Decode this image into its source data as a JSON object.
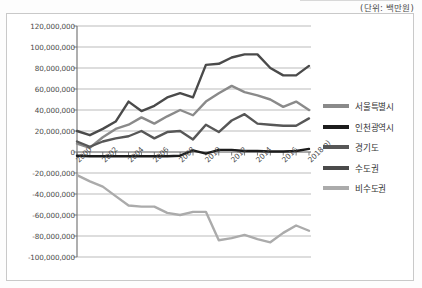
{
  "caption": {
    "unit_note": "(단위: 백만원)"
  },
  "legend": {
    "position": "right",
    "items": [
      {
        "label": "서울특별시",
        "color": "#8a8a8a"
      },
      {
        "label": "인천광역시",
        "color": "#1c1c1c"
      },
      {
        "label": "경기도",
        "color": "#575757"
      },
      {
        "label": "수도권",
        "color": "#4a4a4a"
      },
      {
        "label": "비수도권",
        "color": "#ababab"
      }
    ]
  },
  "chart_data": {
    "type": "line",
    "title": "",
    "subtitle": "",
    "xlabel": "",
    "ylabel": "",
    "unit": "백만원",
    "grid": true,
    "legend_position": "right",
    "ylim": [
      -100000000,
      120000000
    ],
    "ytick_step": 20000000,
    "ytick_labels": [
      "120,000,000",
      "100,000,000",
      "80,000,000",
      "60,000,000",
      "40,000,000",
      "20,000,000",
      "0",
      "-20,000,000",
      "-40,000,000",
      "-60,000,000",
      "-80,000,000",
      "-100,000,000"
    ],
    "ytick_values": [
      120000000,
      100000000,
      80000000,
      60000000,
      40000000,
      20000000,
      0,
      -20000000,
      -40000000,
      -60000000,
      -80000000,
      -100000000
    ],
    "x": [
      2000,
      2001,
      2002,
      2003,
      2004,
      2005,
      2006,
      2007,
      2008,
      2009,
      2010,
      2011,
      2012,
      2013,
      2014,
      2015,
      2016,
      2017,
      2018
    ],
    "xtick_labels": [
      "2000",
      "",
      "2002",
      "",
      "2004",
      "",
      "2006",
      "",
      "2008",
      "",
      "2010",
      "",
      "2012",
      "",
      "2014",
      "",
      "2016",
      "",
      "2018 p)"
    ],
    "series": [
      {
        "name": "서울특별시",
        "color": "#8a8a8a",
        "values": [
          8000000,
          4000000,
          14000000,
          22000000,
          26000000,
          33000000,
          27000000,
          34000000,
          40000000,
          35000000,
          48000000,
          56000000,
          63000000,
          57000000,
          54000000,
          50000000,
          43000000,
          48000000,
          40000000
        ]
      },
      {
        "name": "인천광역시",
        "color": "#1c1c1c",
        "values": [
          -3500000,
          -4000000,
          -4000000,
          -4000000,
          -4000000,
          -4000000,
          -4000000,
          -4000000,
          -3500000,
          1500000,
          -1500000,
          2000000,
          2000000,
          1000000,
          1000000,
          500000,
          500000,
          1000000,
          3000000
        ]
      },
      {
        "name": "경기도",
        "color": "#575757",
        "values": [
          10000000,
          5000000,
          10000000,
          13000000,
          15000000,
          20000000,
          13000000,
          19000000,
          20000000,
          12000000,
          26000000,
          19000000,
          30000000,
          36000000,
          27000000,
          26000000,
          25000000,
          25000000,
          32000000
        ]
      },
      {
        "name": "수도권",
        "color": "#4a4a4a",
        "values": [
          20000000,
          16000000,
          22000000,
          29000000,
          48000000,
          39000000,
          44000000,
          52000000,
          56000000,
          52000000,
          83000000,
          84000000,
          90000000,
          93000000,
          93000000,
          80000000,
          73000000,
          73000000,
          82000000
        ]
      },
      {
        "name": "비수도권",
        "color": "#ababab",
        "values": [
          -22000000,
          -28000000,
          -33000000,
          -42000000,
          -51000000,
          -52000000,
          -52000000,
          -58000000,
          -60000000,
          -57000000,
          -57000000,
          -84000000,
          -82000000,
          -79000000,
          -83000000,
          -86000000,
          -77000000,
          -70000000,
          -75000000
        ]
      }
    ],
    "last_point_note": "2018 p)"
  }
}
